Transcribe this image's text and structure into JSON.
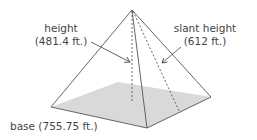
{
  "figure": {
    "type": "square pyramid",
    "labels": {
      "height": {
        "name": "height",
        "value": "(481.4 ft.)"
      },
      "slant_height": {
        "name": "slant height",
        "value": "(612 ft.)"
      },
      "base": {
        "text": "base (755.75 ft.)"
      }
    },
    "colors": {
      "edge": "#555555",
      "base_fill": "#d9d9d9",
      "text": "#444444"
    }
  }
}
